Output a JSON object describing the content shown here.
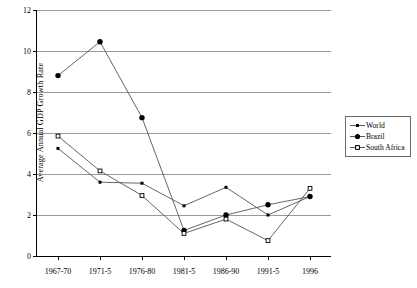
{
  "chart_data": {
    "type": "line",
    "title": "",
    "xlabel": "",
    "ylabel": "Average Annual GDP Growth Rate",
    "categories": [
      "1967-70",
      "1971-5",
      "1976-80",
      "1981-5",
      "1986-90",
      "1991-5",
      "1996"
    ],
    "ylim": [
      0,
      12
    ],
    "yticks": [
      0,
      2,
      4,
      6,
      8,
      10,
      12
    ],
    "ytick_labels": [
      "0",
      "2",
      "4",
      "6",
      "8",
      "10",
      "12"
    ],
    "grid": true,
    "legend_position": "right",
    "series": [
      {
        "name": "World",
        "marker": "small-filled-diamond",
        "color": "#000000",
        "values": [
          5.25,
          3.6,
          3.55,
          2.45,
          3.35,
          2.0,
          2.9
        ]
      },
      {
        "name": "Brazil",
        "marker": "large-filled-circle",
        "color": "#000000",
        "values": [
          8.8,
          10.45,
          6.75,
          1.25,
          2.0,
          2.5,
          2.9
        ]
      },
      {
        "name": "South Africa",
        "marker": "open-square",
        "color": "#000000",
        "values": [
          5.85,
          4.15,
          2.95,
          1.1,
          1.8,
          0.75,
          3.3
        ]
      }
    ]
  },
  "legend": {
    "items": [
      {
        "label": "World"
      },
      {
        "label": "Brazil"
      },
      {
        "label": "South Africa"
      }
    ]
  },
  "colors": {
    "axis": "#000000",
    "gridline": "#9a9a9a",
    "series_line": "#555555",
    "legend_border": "#6b6b6b",
    "background": "#ffffff"
  }
}
